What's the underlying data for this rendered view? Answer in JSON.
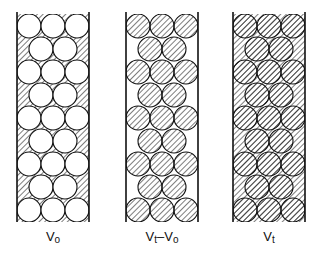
{
  "diagram": {
    "columns": [
      {
        "id": "vo",
        "label_main": "V",
        "label_sub": "o",
        "label_rest": "",
        "label_rest_sub": "",
        "x": 17,
        "circles_hatched": false,
        "interstices_hatched": true
      },
      {
        "id": "vt-vo",
        "label_main": "V",
        "label_sub": "t",
        "label_rest": "–V",
        "label_rest_sub": "o",
        "x": 126,
        "circles_hatched": true,
        "interstices_hatched": false
      },
      {
        "id": "vt",
        "label_main": "V",
        "label_sub": "t",
        "label_rest": "",
        "label_rest_sub": "",
        "x": 233,
        "circles_hatched": true,
        "interstices_hatched": true
      }
    ],
    "column_width": 72,
    "column_top": 14,
    "column_bottom": 222,
    "rows": 9,
    "circle_radius": 12,
    "stroke_color": "#111111"
  }
}
